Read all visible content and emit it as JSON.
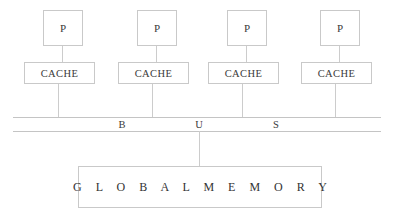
{
  "diagram": {
    "type": "block-diagram",
    "colors": {
      "background": "#ffffff",
      "border": "#c9c9c9",
      "connector": "#cccccc",
      "bus_line": "#c4c4c4",
      "text": "#3a3a3a"
    },
    "processors": [
      {
        "label": "P",
        "x": 43,
        "y": 10
      },
      {
        "label": "P",
        "x": 137,
        "y": 10
      },
      {
        "label": "P",
        "x": 227,
        "y": 10
      },
      {
        "label": "P",
        "x": 320,
        "y": 10
      }
    ],
    "caches": [
      {
        "label": "CACHE",
        "x": 24,
        "y": 62
      },
      {
        "label": "CACHE",
        "x": 118,
        "y": 62
      },
      {
        "label": "CACHE",
        "x": 208,
        "y": 62
      },
      {
        "label": "CACHE",
        "x": 301,
        "y": 62
      }
    ],
    "proc_cache_links": [
      {
        "x": 62,
        "top": 46,
        "height": 16
      },
      {
        "x": 156,
        "top": 46,
        "height": 16
      },
      {
        "x": 246,
        "top": 46,
        "height": 16
      },
      {
        "x": 339,
        "top": 46,
        "height": 16
      }
    ],
    "cache_bus_links": [
      {
        "x": 58,
        "top": 84,
        "height": 34
      },
      {
        "x": 152,
        "top": 84,
        "height": 34
      },
      {
        "x": 242,
        "top": 84,
        "height": 34
      },
      {
        "x": 335,
        "top": 84,
        "height": 34
      }
    ],
    "bus": {
      "label": "BUS",
      "letters": [
        {
          "char": "B",
          "x": 116
        },
        {
          "char": "U",
          "x": 193
        },
        {
          "char": "S",
          "x": 270
        }
      ],
      "left": 13,
      "right": 381,
      "top_y": 117,
      "bottom_y": 131
    },
    "bus_memory_link": {
      "x": 199,
      "top": 131,
      "height": 36
    },
    "memory": {
      "label": "G L O B A L   M E M O R Y",
      "plain_label": "GLOBAL MEMORY",
      "x": 78,
      "y": 166,
      "width": 244,
      "height": 42
    }
  }
}
